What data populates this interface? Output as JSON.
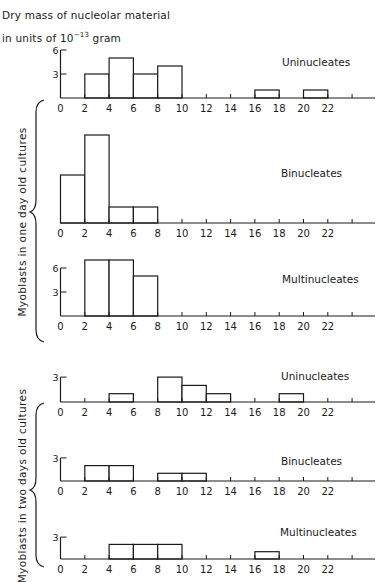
{
  "header": {
    "line1": "Dry mass of nucleolar material",
    "line2_prefix": "in units of 10",
    "line2_exp": "−13",
    "line2_suffix": " gram"
  },
  "groups": [
    {
      "label": "Myoblasts in one day old cultures"
    },
    {
      "label": "Myoblasts in two days old cultures"
    }
  ],
  "chart_data": [
    {
      "type": "bar",
      "title": "Uninucleates",
      "group": "Myoblasts in one day old cultures",
      "xlabel": "Dry mass of nucleolar material (10^-13 gram)",
      "ylabel": "Number of cells",
      "bins": [
        [
          2,
          4
        ],
        [
          4,
          6
        ],
        [
          6,
          8
        ],
        [
          8,
          10
        ],
        [
          16,
          18
        ],
        [
          20,
          22
        ]
      ],
      "values": [
        3,
        5,
        3,
        4,
        1,
        1
      ],
      "yticks": [
        3,
        6
      ],
      "xticks": [
        0,
        2,
        4,
        6,
        8,
        10,
        12,
        14,
        16,
        18,
        20,
        22
      ],
      "xlim": [
        0,
        26
      ]
    },
    {
      "type": "bar",
      "title": "Binucleates",
      "group": "Myoblasts in one day old cultures",
      "xlabel": "Dry mass of nucleolar material (10^-13 gram)",
      "ylabel": "Number of cells",
      "bins": [
        [
          0,
          2
        ],
        [
          2,
          4
        ],
        [
          4,
          6
        ],
        [
          6,
          8
        ]
      ],
      "values": [
        6,
        11,
        2,
        2
      ],
      "yticks": [],
      "xticks": [
        0,
        2,
        4,
        6,
        8,
        10,
        12,
        14,
        16,
        18,
        20,
        22
      ],
      "xlim": [
        0,
        26
      ]
    },
    {
      "type": "bar",
      "title": "Multinucleates",
      "group": "Myoblasts in one day old cultures",
      "xlabel": "Dry mass of nucleolar material (10^-13 gram)",
      "ylabel": "Number of cells",
      "bins": [
        [
          2,
          4
        ],
        [
          4,
          6
        ],
        [
          6,
          8
        ]
      ],
      "values": [
        7,
        7,
        5
      ],
      "yticks": [
        3,
        6
      ],
      "xticks": [
        0,
        2,
        4,
        6,
        8,
        10,
        12,
        14,
        16,
        18,
        20,
        22
      ],
      "xlim": [
        0,
        26
      ]
    },
    {
      "type": "bar",
      "title": "Uninucleates",
      "group": "Myoblasts in two days old cultures",
      "xlabel": "Dry mass of nucleolar material (10^-13 gram)",
      "ylabel": "Number of cells",
      "bins": [
        [
          4,
          6
        ],
        [
          8,
          10
        ],
        [
          10,
          12
        ],
        [
          12,
          14
        ],
        [
          18,
          20
        ]
      ],
      "values": [
        1,
        3,
        2,
        1,
        1
      ],
      "yticks": [
        3
      ],
      "xticks": [
        0,
        2,
        4,
        6,
        8,
        10,
        12,
        14,
        16,
        18,
        20,
        22
      ],
      "xlim": [
        0,
        26
      ]
    },
    {
      "type": "bar",
      "title": "Binucleates",
      "group": "Myoblasts in two days old cultures",
      "xlabel": "Dry mass of nucleolar material (10^-13 gram)",
      "ylabel": "Number of cells",
      "bins": [
        [
          2,
          4
        ],
        [
          4,
          6
        ],
        [
          8,
          10
        ],
        [
          10,
          12
        ]
      ],
      "values": [
        2,
        2,
        1,
        1
      ],
      "yticks": [
        3
      ],
      "xticks": [
        0,
        2,
        4,
        6,
        8,
        10,
        12,
        14,
        16,
        18,
        20,
        22
      ],
      "xlim": [
        0,
        26
      ]
    },
    {
      "type": "bar",
      "title": "Multinucleates",
      "group": "Myoblasts in two days old cultures",
      "xlabel": "Dry mass of nucleolar material (10^-13 gram)",
      "ylabel": "Number of cells",
      "bins": [
        [
          4,
          6
        ],
        [
          6,
          8
        ],
        [
          8,
          10
        ],
        [
          16,
          18
        ]
      ],
      "values": [
        2,
        2,
        2,
        1
      ],
      "yticks": [
        3
      ],
      "xticks": [
        0,
        2,
        4,
        6,
        8,
        10,
        12,
        14,
        16,
        18,
        20,
        22
      ],
      "xlim": [
        0,
        26
      ]
    }
  ],
  "layout": {
    "x0": 60.5,
    "px_per_unit": 12.15,
    "axis_end": 375,
    "extra_tick": 24,
    "panels": [
      {
        "baseline": 98,
        "px_per_count": 8.0,
        "label_x": 282,
        "label_y": 66
      },
      {
        "baseline": 223,
        "px_per_count": 8.0,
        "label_x": 281,
        "label_y": 177
      },
      {
        "baseline": 316,
        "px_per_count": 8.0,
        "label_x": 282,
        "label_y": 283
      },
      {
        "baseline": 402,
        "px_per_count": 8.3,
        "label_x": 281,
        "label_y": 380
      },
      {
        "baseline": 481,
        "px_per_count": 7.7,
        "label_x": 281,
        "label_y": 465
      },
      {
        "baseline": 559,
        "px_per_count": 7.3,
        "label_x": 280,
        "label_y": 536
      }
    ]
  }
}
